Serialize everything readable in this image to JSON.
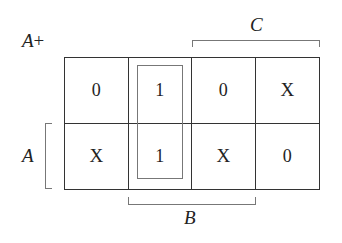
{
  "diagram": {
    "type": "karnaugh-map",
    "title": {
      "var": "A",
      "suffix": "+"
    },
    "variables": {
      "top": "C",
      "left": "A",
      "bottom": "B"
    },
    "rows": [
      [
        "0",
        "1",
        "0",
        "X"
      ],
      [
        "X",
        "1",
        "X",
        "0"
      ]
    ],
    "groups": [
      {
        "column": 2,
        "rows": [
          1,
          2
        ],
        "description": "vertical pair of 1s in column 2"
      }
    ],
    "line_color": "#333333",
    "bracket_color": "#777777"
  }
}
